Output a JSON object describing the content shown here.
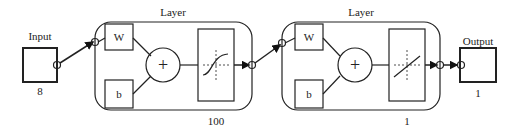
{
  "diagram": {
    "input": {
      "label": "Input",
      "size": "8"
    },
    "layers": [
      {
        "title": "Layer",
        "weight_label": "W",
        "bias_label": "b",
        "sum_symbol": "+",
        "transfer": "sigmoid",
        "size": "100"
      },
      {
        "title": "Layer",
        "weight_label": "W",
        "bias_label": "b",
        "sum_symbol": "+",
        "transfer": "linear",
        "size": "1"
      }
    ],
    "output": {
      "label": "Output",
      "size": "1"
    }
  }
}
